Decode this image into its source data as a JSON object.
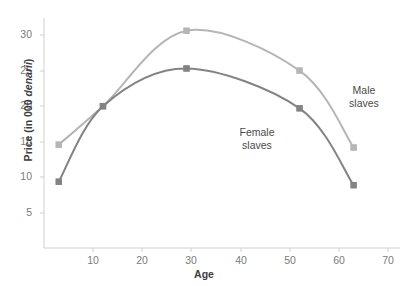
{
  "chart_data": {
    "type": "line",
    "title": "",
    "xlabel": "Age",
    "ylabel": "Price (in 000 denarii)",
    "ylabel_plain": "Price (in 000 ",
    "ylabel_italic": "denarii",
    "ylabel_tail": ")",
    "xlim": [
      0,
      70
    ],
    "ylim": [
      0,
      33
    ],
    "grid": false,
    "legend_position": "inline-annotations",
    "xticks": [
      10,
      20,
      30,
      40,
      50,
      60,
      70
    ],
    "yticks": [
      5,
      10,
      15,
      20,
      25,
      30
    ],
    "series": [
      {
        "name": "Male slaves",
        "label": "Male\nslaves",
        "color": "#b5b5b5",
        "marker": "square",
        "x": [
          3,
          12,
          29,
          52,
          63
        ],
        "values": [
          14.6,
          20.0,
          30.6,
          25.0,
          14.2
        ]
      },
      {
        "name": "Female slaves",
        "label": "Female\nslaves",
        "color": "#838383",
        "marker": "square",
        "x": [
          3,
          12,
          29,
          52,
          63
        ],
        "values": [
          9.4,
          20.0,
          25.3,
          19.7,
          8.9
        ]
      }
    ]
  },
  "axes": {
    "x_title": "Age",
    "x_tick_labels": [
      "10",
      "20",
      "30",
      "40",
      "50",
      "60",
      "70"
    ],
    "y_tick_labels": [
      "5",
      "10",
      "15",
      "20",
      "25",
      "30"
    ],
    "axis_color": "#d0d0d0",
    "tick_label_color": "#7b7b7b"
  },
  "annotations": {
    "male": "Male\nslaves",
    "female": "Female\nslaves"
  }
}
